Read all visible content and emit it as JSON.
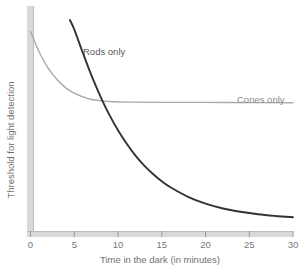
{
  "chart_data": {
    "type": "line",
    "title": "",
    "subtitle": "",
    "xlabel": "Time in the dark (in minutes)",
    "ylabel": "Threshold for light detection",
    "xlim": [
      0,
      30
    ],
    "ylim": [
      0,
      1
    ],
    "xticks": [
      "0",
      "5",
      "10",
      "15",
      "20",
      "25",
      "30"
    ],
    "xtick_values": [
      0,
      5,
      10,
      15,
      20,
      25,
      30
    ],
    "yticks": [],
    "grid": false,
    "legend": "inline-annotations",
    "annotations": [
      {
        "text": "Rods only",
        "x": 6.0,
        "y": 0.83
      },
      {
        "text": "Cones only",
        "x": 23.6,
        "y": 0.6
      }
    ],
    "series": [
      {
        "name": "Cones only",
        "color": "#aaaaaa",
        "x": [
          0,
          1,
          2,
          3,
          4,
          5,
          6,
          7,
          8,
          9,
          10,
          12,
          15,
          20,
          25,
          30
        ],
        "values": [
          0.945,
          0.845,
          0.77,
          0.715,
          0.675,
          0.648,
          0.63,
          0.618,
          0.612,
          0.608,
          0.606,
          0.605,
          0.604,
          0.604,
          0.603,
          0.602
        ]
      },
      {
        "name": "Rods only",
        "color": "#333333",
        "x": [
          4.5,
          5,
          6,
          7,
          8,
          9,
          10,
          11,
          12,
          13,
          14,
          15,
          16,
          18,
          20,
          22,
          24,
          26,
          28,
          30
        ],
        "values": [
          1.0,
          0.955,
          0.84,
          0.73,
          0.632,
          0.545,
          0.47,
          0.405,
          0.348,
          0.3,
          0.26,
          0.225,
          0.196,
          0.15,
          0.117,
          0.094,
          0.078,
          0.066,
          0.058,
          0.052
        ]
      }
    ],
    "axis_color": "#d9d9d9",
    "axis_edge_color": "#bdbdbd",
    "tick_color": "#9a9a9a",
    "background": "#ffffff"
  }
}
